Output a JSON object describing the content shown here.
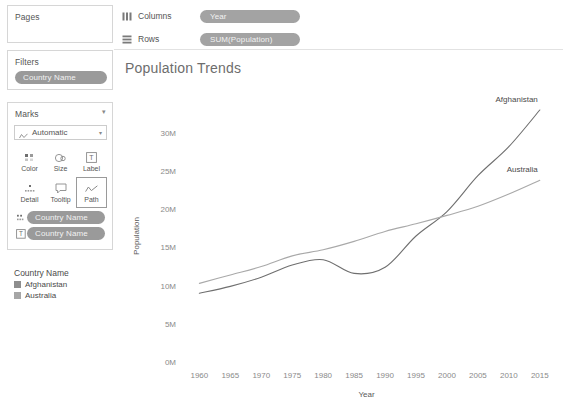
{
  "left_panel": {
    "pages": {
      "title": "Pages"
    },
    "filters": {
      "title": "Filters",
      "pill": "Country Name"
    },
    "marks": {
      "title": "Marks",
      "mark_type": "Automatic",
      "buttons": [
        {
          "name": "color",
          "label": "Color",
          "icon": "color-squares-icon"
        },
        {
          "name": "size",
          "label": "Size",
          "icon": "size-circles-icon"
        },
        {
          "name": "label",
          "label": "Label",
          "icon": "label-text-icon"
        },
        {
          "name": "detail",
          "label": "Detail",
          "icon": "detail-dots-icon"
        },
        {
          "name": "tooltip",
          "label": "Tooltip",
          "icon": "tooltip-bubble-icon"
        },
        {
          "name": "path",
          "label": "Path",
          "icon": "path-line-icon"
        }
      ],
      "active_button": "path",
      "pills": [
        {
          "icon": "detail-dots-icon",
          "label": "Country Name"
        },
        {
          "icon": "label-text-icon",
          "label": "Country Name"
        }
      ]
    },
    "legend": {
      "title": "Country Name",
      "items": [
        {
          "label": "Afghanistan",
          "color": "#8e8e8e"
        },
        {
          "label": "Australia",
          "color": "#a6a6a6"
        }
      ]
    }
  },
  "shelves": [
    {
      "name": "Columns",
      "icon": "columns-icon",
      "pill": "Year"
    },
    {
      "name": "Rows",
      "icon": "rows-icon",
      "pill": "SUM(Population)"
    }
  ],
  "chart_data": {
    "type": "line",
    "title": "Population Trends",
    "xlabel": "Year",
    "ylabel": "Population",
    "xlim": [
      1958,
      2016
    ],
    "ylim": [
      0,
      33
    ],
    "xticks": [
      1960,
      1965,
      1970,
      1975,
      1980,
      1985,
      1990,
      1995,
      2000,
      2005,
      2010,
      2015
    ],
    "yticks": [
      0,
      5,
      10,
      15,
      20,
      25,
      30
    ],
    "ytick_labels": [
      "0M",
      "5M",
      "10M",
      "15M",
      "20M",
      "25M",
      "30M"
    ],
    "y_unit": "millions",
    "grid": false,
    "legend_position": "inline-right",
    "x": [
      1960,
      1965,
      1970,
      1975,
      1980,
      1985,
      1990,
      1995,
      2000,
      2005,
      2010,
      2015
    ],
    "series": [
      {
        "name": "Afghanistan",
        "color": "#6f6f6f",
        "values": [
          9.0,
          9.9,
          11.1,
          12.7,
          13.4,
          11.6,
          12.4,
          16.5,
          19.7,
          24.4,
          28.2,
          33.0
        ],
        "label": "Afghanistan"
      },
      {
        "name": "Australia",
        "color": "#a9a9a9",
        "values": [
          10.3,
          11.4,
          12.5,
          13.9,
          14.7,
          15.8,
          17.1,
          18.1,
          19.2,
          20.4,
          22.0,
          23.8
        ],
        "label": "Australia"
      }
    ]
  }
}
